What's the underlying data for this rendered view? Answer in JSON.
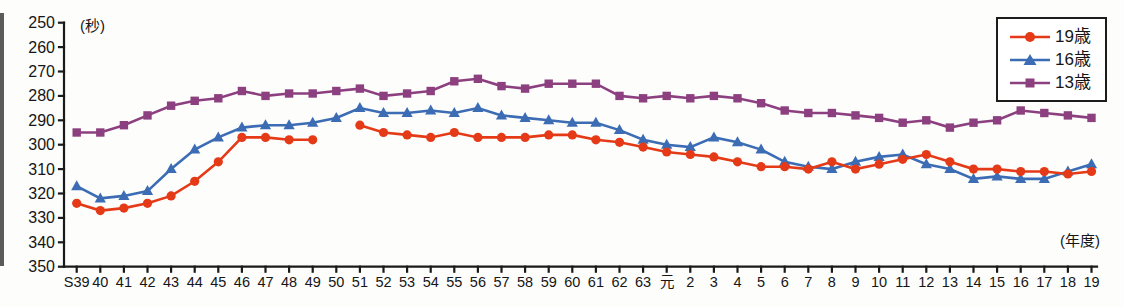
{
  "chart_data": {
    "type": "line",
    "title": "",
    "ylabel": "(秒)",
    "xlabel": "(年度)",
    "y_inverted": true,
    "ylim": [
      250,
      350
    ],
    "yticks": [
      250,
      260,
      270,
      280,
      290,
      300,
      310,
      320,
      330,
      340,
      350
    ],
    "grid": false,
    "legend_position": "top-right",
    "categories": [
      "S39",
      "40",
      "41",
      "42",
      "43",
      "44",
      "45",
      "46",
      "47",
      "48",
      "49",
      "50",
      "51",
      "52",
      "53",
      "54",
      "55",
      "56",
      "57",
      "58",
      "59",
      "60",
      "61",
      "62",
      "63",
      "元",
      "2",
      "3",
      "4",
      "5",
      "6",
      "7",
      "8",
      "9",
      "10",
      "11",
      "12",
      "13",
      "14",
      "15",
      "16",
      "17",
      "18",
      "19"
    ],
    "series": [
      {
        "id": "age-19",
        "name": "19歳",
        "marker": "circle",
        "color": "#e53a17",
        "values": [
          324,
          327,
          326,
          324,
          321,
          315,
          307,
          297,
          297,
          298,
          298,
          null,
          292,
          295,
          296,
          297,
          295,
          297,
          297,
          297,
          296,
          296,
          298,
          299,
          301,
          303,
          304,
          305,
          307,
          309,
          309,
          310,
          307,
          310,
          308,
          306,
          304,
          307,
          310,
          310,
          311,
          311,
          312,
          311
        ]
      },
      {
        "id": "age-16",
        "name": "16歳",
        "marker": "triangle",
        "color": "#3b6cb4",
        "values": [
          317,
          322,
          321,
          319,
          310,
          302,
          297,
          293,
          292,
          292,
          291,
          289,
          285,
          287,
          287,
          286,
          287,
          285,
          288,
          289,
          290,
          291,
          291,
          294,
          298,
          300,
          301,
          297,
          299,
          302,
          307,
          309,
          310,
          307,
          305,
          304,
          308,
          310,
          314,
          313,
          314,
          314,
          311,
          308
        ]
      },
      {
        "id": "age-13",
        "name": "13歳",
        "marker": "square",
        "color": "#8d4080",
        "values": [
          295,
          295,
          292,
          288,
          284,
          282,
          281,
          278,
          280,
          279,
          279,
          278,
          277,
          280,
          279,
          278,
          274,
          273,
          276,
          277,
          275,
          275,
          275,
          280,
          281,
          280,
          281,
          280,
          281,
          283,
          286,
          287,
          287,
          288,
          289,
          291,
          290,
          293,
          291,
          290,
          286,
          287,
          288,
          289
        ]
      }
    ]
  }
}
